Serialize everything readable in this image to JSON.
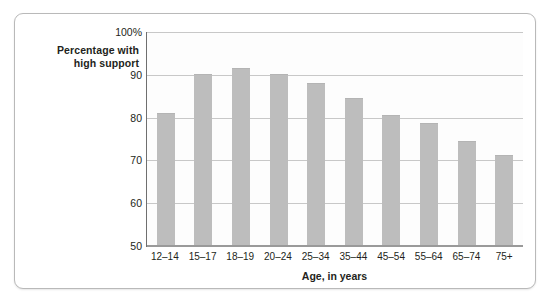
{
  "chart_data": {
    "type": "bar",
    "title": "",
    "xlabel": "Age, in years",
    "ylabel": "Percentage with high support",
    "ylabel_line1": "Percentage with",
    "ylabel_line2": "high support",
    "categories": [
      "12–14",
      "15–17",
      "18–19",
      "20–24",
      "25–34",
      "35–44",
      "45–54",
      "55–64",
      "65–74",
      "75+"
    ],
    "values": [
      81,
      90,
      91.5,
      90,
      88,
      84.5,
      80.5,
      78.5,
      74.3,
      71
    ],
    "ylim": [
      50,
      100
    ],
    "ytick_labels": [
      "100%",
      "90",
      "80",
      "70",
      "60",
      "50"
    ],
    "ytick_values": [
      100,
      90,
      80,
      70,
      60,
      50
    ],
    "grid": true,
    "legend": "none",
    "bar_color": "#bdbdbd",
    "axis_color": "#6f6f6f",
    "grid_color": "#c8c8c8",
    "text_color": "#231f20",
    "background_color": "#ffffff"
  }
}
